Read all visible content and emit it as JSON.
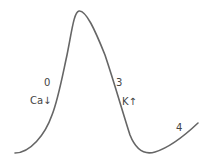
{
  "diagram": {
    "type": "action-potential-curve",
    "curve_color": "#666666",
    "label_color": "#444444",
    "labels": {
      "phase0": "0",
      "phase0_ion": "Ca↓",
      "phase3": "3",
      "phase3_ion": "K↑",
      "phase4": "4"
    }
  }
}
